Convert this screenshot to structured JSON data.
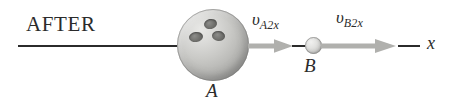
{
  "figure": {
    "phase_label": "AFTER",
    "axis_label": "x",
    "background_color": "#ffffff",
    "line_color": "#2b2b2b",
    "arrow_color": "#b0b0ad"
  },
  "bodies": [
    {
      "id": "A",
      "label": "A",
      "kind": "bowling-ball",
      "hole_count": 3
    },
    {
      "id": "B",
      "label": "B",
      "kind": "small-ball",
      "hole_count": 0
    }
  ],
  "velocities": [
    {
      "id": "v-A2x",
      "symbol": "υ",
      "subscript": "A2x",
      "direction": "right",
      "belongs_to": "A"
    },
    {
      "id": "v-B2x",
      "symbol": "υ",
      "subscript": "B2x",
      "direction": "right",
      "belongs_to": "B"
    }
  ]
}
